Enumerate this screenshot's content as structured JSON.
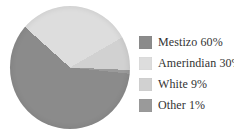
{
  "chart_data": {
    "type": "pie",
    "title": "",
    "categories": [
      "Mestizo",
      "Amerindian",
      "White",
      "Other"
    ],
    "values": [
      60,
      30,
      9,
      1
    ],
    "unit": "%",
    "slices": [
      {
        "label": "Mestizo",
        "value": 60,
        "color": "#8b8b8b",
        "legend_label": "Mestizo 60%"
      },
      {
        "label": "Amerindian",
        "value": 30,
        "color": "#dddddd",
        "legend_label": "Amerindian 30%"
      },
      {
        "label": "White",
        "value": 9,
        "color": "#d1d1d1",
        "legend_label": "White 9%"
      },
      {
        "label": "Other",
        "value": 1,
        "color": "#9a9a9a",
        "legend_label": "Other 1%"
      }
    ],
    "legend_position": "right",
    "start_angle_deg": -48,
    "direction": "clockwise",
    "order_clockwise_from_start": [
      "Amerindian",
      "White",
      "Other",
      "Mestizo"
    ],
    "colors": {
      "background": "#ffffff",
      "legend_text": "#333333"
    }
  }
}
